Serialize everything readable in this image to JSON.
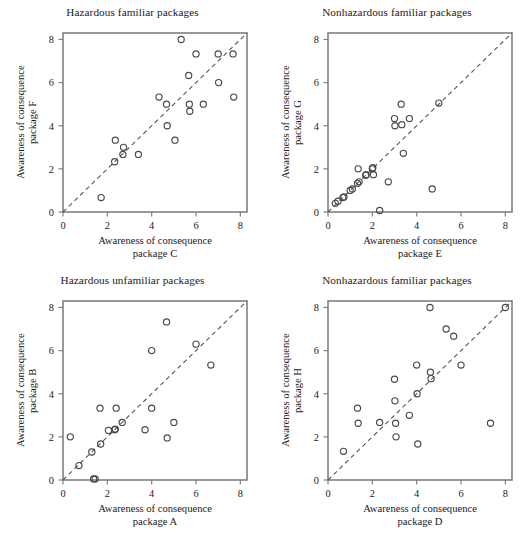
{
  "figure": {
    "background_color": "#ffffff",
    "axis_color": "#808080",
    "marker_color": "#4a4a4a",
    "reference_line_color": "#555555",
    "marker_radius": 3.1,
    "panel_count": 4
  },
  "axis": {
    "ticks": [
      0,
      2,
      4,
      6,
      8
    ],
    "tick_labels": [
      "0",
      "2",
      "4",
      "6",
      "8"
    ],
    "min": 0,
    "max": 8.3,
    "grid": false
  },
  "chart_data": [
    {
      "id": "hazardous-familiar",
      "type": "scatter",
      "title": "Hazardous familiar packages",
      "xlabel": "Awareness of consequence\npackage C",
      "xlabel_line1": "Awareness of consequence",
      "xlabel_line2": "package C",
      "ylabel": "Awareness of consequence\npackage F",
      "ylabel_line1": "Awareness of consequence",
      "ylabel_line2": "package F",
      "xlim": [
        0,
        8.3
      ],
      "ylim": [
        0,
        8.3
      ],
      "xticks": [
        0,
        2,
        4,
        6,
        8
      ],
      "yticks": [
        0,
        2,
        4,
        6,
        8
      ],
      "reference_line": {
        "type": "identity",
        "style": "dashed",
        "from": [
          0,
          0
        ],
        "to": [
          8.3,
          8.3
        ]
      },
      "points": [
        {
          "x": 1.72,
          "y": 0.67
        },
        {
          "x": 2.33,
          "y": 2.33
        },
        {
          "x": 2.36,
          "y": 3.33
        },
        {
          "x": 2.7,
          "y": 2.67
        },
        {
          "x": 2.73,
          "y": 3.0
        },
        {
          "x": 3.4,
          "y": 2.67
        },
        {
          "x": 4.33,
          "y": 5.33
        },
        {
          "x": 4.67,
          "y": 5.0
        },
        {
          "x": 4.7,
          "y": 4.0
        },
        {
          "x": 5.05,
          "y": 3.33
        },
        {
          "x": 5.33,
          "y": 8.0
        },
        {
          "x": 5.67,
          "y": 6.33
        },
        {
          "x": 5.7,
          "y": 5.0
        },
        {
          "x": 5.72,
          "y": 4.67
        },
        {
          "x": 6.0,
          "y": 7.33
        },
        {
          "x": 6.33,
          "y": 5.0
        },
        {
          "x": 7.0,
          "y": 7.33
        },
        {
          "x": 7.02,
          "y": 6.0
        },
        {
          "x": 7.67,
          "y": 7.33
        },
        {
          "x": 7.7,
          "y": 5.33
        }
      ]
    },
    {
      "id": "nonhazardous-familiar-eg",
      "type": "scatter",
      "title": "Nonhazardous familiar packages",
      "xlabel": "Awareness of consequence\npackage E",
      "xlabel_line1": "Awareness of consequence",
      "xlabel_line2": "package E",
      "ylabel": "Awareness of consequence\npackage G",
      "ylabel_line1": "Awareness of consequence",
      "ylabel_line2": "package G",
      "xlim": [
        0,
        8.3
      ],
      "ylim": [
        0,
        8.3
      ],
      "xticks": [
        0,
        2,
        4,
        6,
        8
      ],
      "yticks": [
        0,
        2,
        4,
        6,
        8
      ],
      "reference_line": {
        "type": "identity",
        "style": "dashed",
        "from": [
          0,
          0
        ],
        "to": [
          8.3,
          8.3
        ]
      },
      "points": [
        {
          "x": 0.33,
          "y": 0.4
        },
        {
          "x": 0.45,
          "y": 0.5
        },
        {
          "x": 0.67,
          "y": 0.67
        },
        {
          "x": 0.72,
          "y": 0.7
        },
        {
          "x": 1.0,
          "y": 1.0
        },
        {
          "x": 1.1,
          "y": 1.07
        },
        {
          "x": 1.33,
          "y": 1.33
        },
        {
          "x": 1.36,
          "y": 2.0
        },
        {
          "x": 1.4,
          "y": 1.4
        },
        {
          "x": 1.7,
          "y": 1.7
        },
        {
          "x": 1.72,
          "y": 1.73
        },
        {
          "x": 2.0,
          "y": 2.0
        },
        {
          "x": 2.02,
          "y": 2.05
        },
        {
          "x": 2.05,
          "y": 1.73
        },
        {
          "x": 2.33,
          "y": 0.07
        },
        {
          "x": 2.72,
          "y": 1.4
        },
        {
          "x": 3.0,
          "y": 4.33
        },
        {
          "x": 3.02,
          "y": 4.0
        },
        {
          "x": 3.3,
          "y": 5.0
        },
        {
          "x": 3.33,
          "y": 4.05
        },
        {
          "x": 3.4,
          "y": 2.72
        },
        {
          "x": 3.67,
          "y": 4.33
        },
        {
          "x": 4.7,
          "y": 1.07
        },
        {
          "x": 5.0,
          "y": 5.05
        }
      ]
    },
    {
      "id": "hazardous-unfamiliar",
      "type": "scatter",
      "title": "Hazardous unfamiliar packages",
      "xlabel": "Awareness of consequence\npackage A",
      "xlabel_line1": "Awareness of consequence",
      "xlabel_line2": "package A",
      "ylabel": "Awareness of consequence\npackage B",
      "ylabel_line1": "Awareness of consequence",
      "ylabel_line2": "package B",
      "xlim": [
        0,
        8.3
      ],
      "ylim": [
        0,
        8.3
      ],
      "xticks": [
        0,
        2,
        4,
        6,
        8
      ],
      "yticks": [
        0,
        2,
        4,
        6,
        8
      ],
      "reference_line": {
        "type": "identity",
        "style": "dashed",
        "from": [
          0,
          0
        ],
        "to": [
          8.3,
          8.3
        ]
      },
      "points": [
        {
          "x": 0.33,
          "y": 2.0
        },
        {
          "x": 0.72,
          "y": 0.67
        },
        {
          "x": 1.3,
          "y": 1.3
        },
        {
          "x": 1.38,
          "y": 0.05
        },
        {
          "x": 1.45,
          "y": 0.05
        },
        {
          "x": 1.67,
          "y": 3.33
        },
        {
          "x": 1.7,
          "y": 1.67
        },
        {
          "x": 2.05,
          "y": 2.3
        },
        {
          "x": 2.33,
          "y": 2.33
        },
        {
          "x": 2.36,
          "y": 2.36
        },
        {
          "x": 2.4,
          "y": 3.33
        },
        {
          "x": 2.67,
          "y": 2.67
        },
        {
          "x": 3.7,
          "y": 2.33
        },
        {
          "x": 4.0,
          "y": 6.0
        },
        {
          "x": 4.0,
          "y": 3.33
        },
        {
          "x": 4.67,
          "y": 7.33
        },
        {
          "x": 4.7,
          "y": 1.95
        },
        {
          "x": 5.0,
          "y": 2.67
        },
        {
          "x": 6.0,
          "y": 6.3
        },
        {
          "x": 6.67,
          "y": 5.33
        }
      ]
    },
    {
      "id": "nonhazardous-familiar-dh",
      "type": "scatter",
      "title": "Nonhazardous familiar packages",
      "xlabel": "Awareness of consequence\npackage D",
      "xlabel_line1": "Awareness of consequence",
      "xlabel_line2": "package D",
      "ylabel": "Awareness of consequence\npackage H",
      "ylabel_line1": "Awareness of consequence",
      "ylabel_line2": "package H",
      "xlim": [
        0,
        8.3
      ],
      "ylim": [
        0,
        8.3
      ],
      "xticks": [
        0,
        2,
        4,
        6,
        8
      ],
      "yticks": [
        0,
        2,
        4,
        6,
        8
      ],
      "reference_line": {
        "type": "identity",
        "style": "dashed",
        "from": [
          0,
          0
        ],
        "to": [
          8.3,
          8.3
        ]
      },
      "points": [
        {
          "x": 0.7,
          "y": 1.33
        },
        {
          "x": 1.33,
          "y": 3.33
        },
        {
          "x": 1.36,
          "y": 2.63
        },
        {
          "x": 2.33,
          "y": 2.67
        },
        {
          "x": 3.0,
          "y": 4.67
        },
        {
          "x": 3.02,
          "y": 3.67
        },
        {
          "x": 3.05,
          "y": 2.63
        },
        {
          "x": 3.07,
          "y": 2.0
        },
        {
          "x": 3.67,
          "y": 3.0
        },
        {
          "x": 4.0,
          "y": 5.33
        },
        {
          "x": 4.02,
          "y": 4.0
        },
        {
          "x": 4.05,
          "y": 1.67
        },
        {
          "x": 4.6,
          "y": 8.0
        },
        {
          "x": 4.62,
          "y": 5.0
        },
        {
          "x": 4.65,
          "y": 4.7
        },
        {
          "x": 5.33,
          "y": 7.0
        },
        {
          "x": 5.67,
          "y": 6.67
        },
        {
          "x": 6.0,
          "y": 5.33
        },
        {
          "x": 7.33,
          "y": 2.63
        },
        {
          "x": 8.0,
          "y": 8.0
        }
      ]
    }
  ]
}
